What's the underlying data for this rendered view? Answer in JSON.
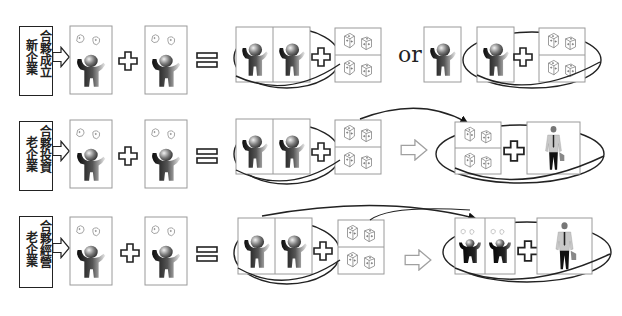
{
  "diagram": {
    "rows": [
      {
        "id": "row-1",
        "label_left": "新企業",
        "label_right": "合夥成立",
        "connector": "or",
        "result_description": "two founders pooled with dice OR single founder + (founder + dice)"
      },
      {
        "id": "row-2",
        "label_left": "老企業",
        "label_right": "合夥投資",
        "connector_arrow": "hollow-right-arrow",
        "result_description": "dice capital transferred to new entity with businessman"
      },
      {
        "id": "row-3",
        "label_left": "老企業",
        "label_right": "合夥經營",
        "connector_arrow": "hollow-right-arrow",
        "result_description": "two partners moved to new entity with businessman"
      }
    ],
    "symbols": {
      "plus": "+",
      "equals": "=",
      "or": "or"
    },
    "colors": {
      "line": "#222222",
      "box_border": "#8a8a8a",
      "figure_dark": "#1a1a1a",
      "figure_light": "#e6e6e6",
      "arrow_hollow_border": "#9a9a9a"
    }
  }
}
